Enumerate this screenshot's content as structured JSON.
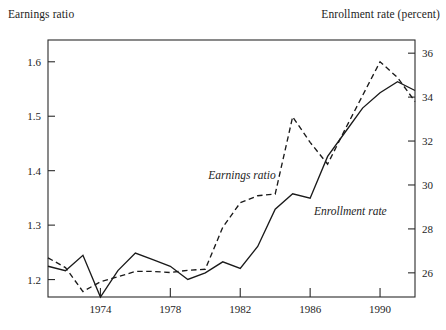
{
  "chart_data": {
    "type": "line",
    "title": "",
    "subtitle": "",
    "grid": false,
    "legend_position": "inline-annotation",
    "xlabel": "",
    "xlim": [
      1971,
      1992
    ],
    "x_ticks": [
      1974,
      1978,
      1982,
      1986,
      1990
    ],
    "x_tick_labels": [
      "1974",
      "1978",
      "1982",
      "1986",
      "1990"
    ],
    "axes": [
      {
        "id": "left",
        "label": "Earnings ratio",
        "ylim": [
          1.168,
          1.64
        ],
        "ticks": [
          1.2,
          1.3,
          1.4,
          1.5,
          1.6
        ],
        "tick_labels": [
          "1.2",
          "1.3",
          "1.4",
          "1.5",
          "1.6"
        ]
      },
      {
        "id": "right",
        "label": "Enrollment rate (percent)",
        "ylim": [
          24.9,
          36.6
        ],
        "ticks": [
          26,
          28,
          30,
          32,
          34,
          36
        ],
        "tick_labels": [
          "26",
          "28",
          "30",
          "32",
          "34",
          "36"
        ]
      }
    ],
    "x": [
      1971,
      1972,
      1973,
      1974,
      1975,
      1976,
      1977,
      1978,
      1979,
      1980,
      1981,
      1982,
      1983,
      1984,
      1985,
      1986,
      1987,
      1988,
      1989,
      1990,
      1991,
      1992
    ],
    "series": [
      {
        "name": "Earnings ratio",
        "axis": "left",
        "style": "dashed",
        "annotation": "Earnings ratio",
        "values": [
          1.24,
          1.222,
          1.178,
          1.196,
          1.205,
          1.215,
          1.215,
          1.213,
          1.217,
          1.219,
          1.296,
          1.341,
          1.354,
          1.357,
          1.499,
          1.452,
          1.412,
          1.476,
          1.538,
          1.6,
          1.571,
          1.527
        ]
      },
      {
        "name": "Enrollment rate",
        "axis": "right",
        "style": "solid",
        "annotation": "Enrollment rate",
        "values": [
          26.3,
          26.1,
          26.8,
          24.9,
          26.1,
          26.9,
          26.6,
          26.3,
          25.7,
          26.0,
          26.5,
          26.2,
          27.2,
          28.9,
          29.6,
          29.4,
          31.3,
          32.4,
          33.5,
          34.2,
          34.7,
          34.3
        ]
      }
    ],
    "annotations": [
      {
        "text": "Earnings ratio",
        "x": 1982.1,
        "y_axis": "left",
        "y": 1.385
      },
      {
        "text": "Enrollment rate",
        "x": 1988.3,
        "y_axis": "left",
        "y": 1.318
      }
    ]
  },
  "labels": {
    "left_axis_title": "Earnings ratio",
    "right_axis_title": "Enrollment rate (percent)"
  },
  "colors": {
    "ink": "#1a1a1a",
    "frame": "#2b2b2b",
    "background": "#ffffff"
  }
}
